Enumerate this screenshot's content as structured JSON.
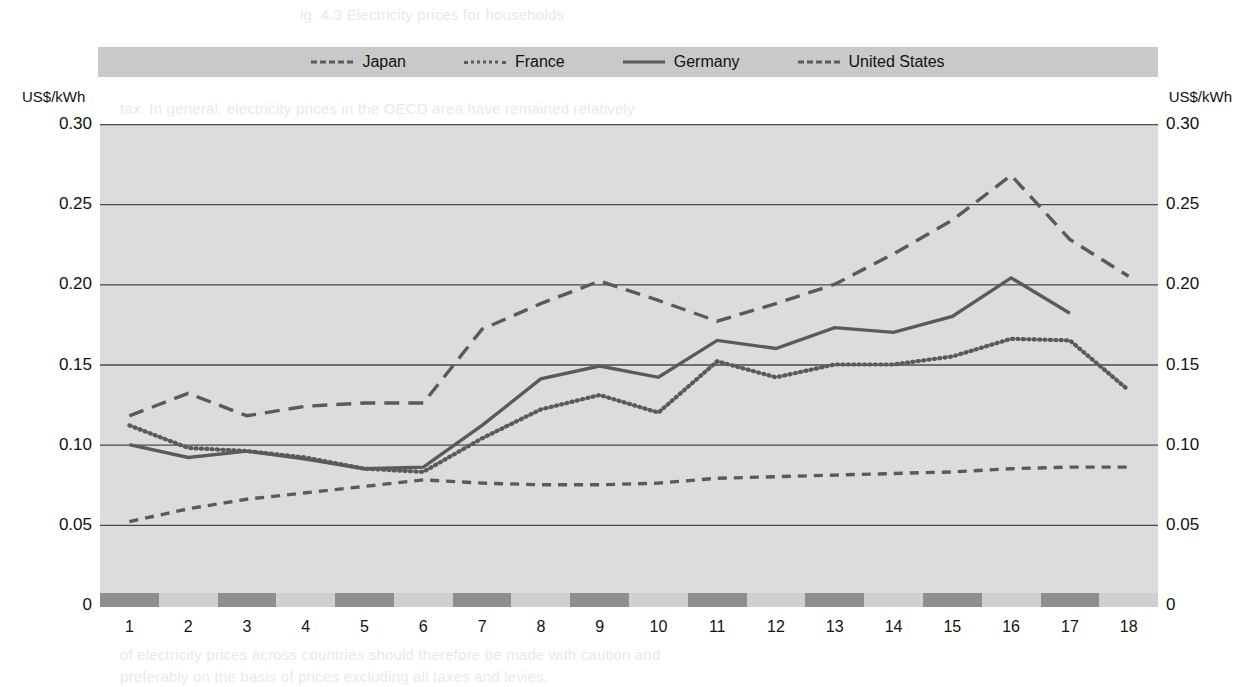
{
  "legend": {
    "items": [
      {
        "label": "Japan",
        "style": "dashed",
        "sample": "dashed-line-sample"
      },
      {
        "label": "France",
        "style": "dotted",
        "sample": "dotted-line-sample"
      },
      {
        "label": "Germany",
        "style": "solid",
        "sample": "solid-line-sample"
      },
      {
        "label": "United States",
        "style": "dashed-short",
        "sample": "short-dashed-line-sample"
      }
    ]
  },
  "axis": {
    "unit_left": "US$/kWh",
    "unit_right": "US$/kWh",
    "y_ticks": [
      "0.30",
      "0.25",
      "0.20",
      "0.15",
      "0.10",
      "0.05",
      "0"
    ],
    "x_ticks": [
      "1",
      "2",
      "3",
      "4",
      "5",
      "6",
      "7",
      "8",
      "9",
      "10",
      "11",
      "12",
      "13",
      "14",
      "15",
      "16",
      "17",
      "18"
    ]
  },
  "colors": {
    "line": "#5a5a5a",
    "grid": "#4a4a4a",
    "plot_background": "#dcdcdc",
    "legend_background": "#c9c9c9",
    "band_dark": "#8f8f8f",
    "band_light": "#d0d0d0"
  },
  "chart_data": {
    "type": "line",
    "title": "",
    "xlabel": "",
    "ylabel": "US$/kWh",
    "ylim": [
      0,
      0.3
    ],
    "yticks": [
      0,
      0.05,
      0.1,
      0.15,
      0.2,
      0.25,
      0.3
    ],
    "grid": "horizontal",
    "legend_position": "top",
    "categories": [
      "1",
      "2",
      "3",
      "4",
      "5",
      "6",
      "7",
      "8",
      "9",
      "10",
      "11",
      "12",
      "13",
      "14",
      "15",
      "16",
      "17",
      "18"
    ],
    "series": [
      {
        "name": "Japan",
        "style": "dashed",
        "values": [
          0.118,
          0.132,
          0.118,
          0.124,
          0.126,
          0.126,
          0.172,
          0.188,
          0.202,
          0.19,
          0.177,
          0.188,
          0.2,
          0.219,
          0.24,
          0.268,
          0.228,
          0.205
        ]
      },
      {
        "name": "France",
        "style": "dotted",
        "values": [
          0.112,
          0.098,
          0.096,
          0.092,
          0.085,
          0.083,
          0.104,
          0.122,
          0.131,
          0.12,
          0.152,
          0.142,
          0.15,
          0.15,
          0.155,
          0.166,
          0.165,
          0.134
        ]
      },
      {
        "name": "Germany",
        "style": "solid",
        "values": [
          0.1,
          0.092,
          0.096,
          0.091,
          0.085,
          0.086,
          0.112,
          0.141,
          0.149,
          0.142,
          0.165,
          0.16,
          0.173,
          0.17,
          0.18,
          0.204,
          0.182,
          null
        ]
      },
      {
        "name": "United States",
        "style": "dashed-short",
        "values": [
          0.052,
          0.06,
          0.066,
          0.07,
          0.074,
          0.078,
          0.076,
          0.075,
          0.075,
          0.076,
          0.079,
          0.08,
          0.081,
          0.082,
          0.083,
          0.085,
          0.086,
          0.086
        ]
      }
    ]
  },
  "background_text": {
    "lines": [
      {
        "x": 300,
        "y": 6,
        "text": "ig. 4.3   Electricity prices for households"
      },
      {
        "x": 120,
        "y": 100,
        "text": "tax. In general, electricity prices in the OECD area have remained relatively"
      },
      {
        "x": 120,
        "y": 122,
        "text": "stable, although the burden of taxation and levies varies widely between"
      },
      {
        "x": 120,
        "y": 144,
        "text": "countries and is particularly high for the domestic sector."
      },
      {
        "x": 120,
        "y": 196,
        "text": "Industry consumers in most countries still face lower effective prices than"
      },
      {
        "x": 120,
        "y": 218,
        "text": "households, reflecting both the structure of demand and the different supply"
      },
      {
        "x": 120,
        "y": 240,
        "text": "costs associated with low-voltage delivery. However, the gap has narrowed."
      },
      {
        "x": 120,
        "y": 394,
        "text": "Since the mid-1990s, electricity prices measured in US dollars have shown a"
      },
      {
        "x": 120,
        "y": 416,
        "text": "modest upward trend, with a marked acceleration after 2003 as fuel costs and"
      },
      {
        "x": 120,
        "y": 438,
        "text": "carbon-related charges were passed through to final consumers."
      },
      {
        "x": 120,
        "y": 530,
        "text": "Taxes make the international comparison of electricity prices more difficult, as"
      },
      {
        "x": 120,
        "y": 552,
        "text": "the treatment of value added tax differs from country to country. The comparison"
      },
      {
        "x": 120,
        "y": 646,
        "text": "of electricity prices across countries should therefore be made with caution and"
      },
      {
        "x": 120,
        "y": 668,
        "text": "preferably on the basis of prices excluding all taxes and levies."
      }
    ]
  }
}
